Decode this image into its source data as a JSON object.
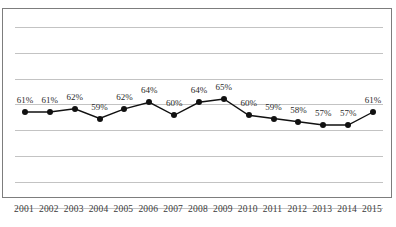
{
  "figure": {
    "title_partial": "",
    "background_color": "#ffffff",
    "frame_color": "#7d7d7d",
    "grid_color": "#c3c3c3",
    "series_color": "#111111",
    "label_color": "#2b2b2b",
    "tick_color": "#3a3a3a"
  },
  "chart_data": {
    "type": "line",
    "title": "",
    "xlabel": "",
    "ylabel": "",
    "categories": [
      "2001",
      "2002",
      "2003",
      "2004",
      "2005",
      "2006",
      "2007",
      "2008",
      "2009",
      "2010",
      "2011",
      "2012",
      "2013",
      "2014",
      "2015"
    ],
    "values": [
      61,
      61,
      62,
      59,
      62,
      64,
      60,
      64,
      65,
      60,
      59,
      58,
      57,
      57,
      61
    ],
    "data_labels": [
      "61%",
      "61%",
      "62%",
      "59%",
      "62%",
      "64%",
      "60%",
      "64%",
      "65%",
      "60%",
      "59%",
      "58%",
      "57%",
      "57%",
      "61%"
    ],
    "units": "%",
    "ylim": [
      50,
      72
    ],
    "grid": true,
    "gridline_count": 8,
    "legend": null,
    "legend_position": "none",
    "markers": true,
    "marker_shape": "circle"
  }
}
